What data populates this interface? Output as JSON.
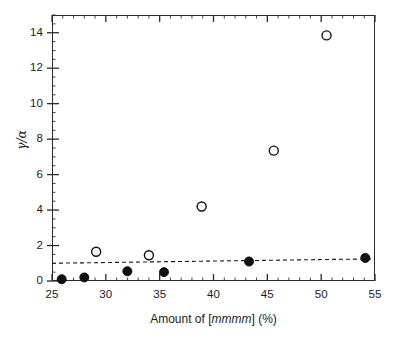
{
  "figure": {
    "background_color": "#ffffff",
    "axis_color": "#2b2b2b"
  },
  "axes": {
    "x_title_prefix": "Amount of [",
    "x_title_italic": "mmmm",
    "x_title_suffix": "] (%)",
    "x_title_full": "Amount of [mmmm] (%)",
    "y_title": "γ/α"
  },
  "chart_data": {
    "type": "scatter",
    "title": "",
    "xlabel": "Amount of [mmmm] (%)",
    "ylabel": "γ/α",
    "xlim": [
      25,
      55
    ],
    "ylim": [
      0,
      15
    ],
    "x_major_ticks": [
      25,
      30,
      35,
      40,
      45,
      50,
      55
    ],
    "x_major_tick_labels": [
      "25",
      "30",
      "35",
      "40",
      "45",
      "50",
      "55"
    ],
    "x_minor_tick_step": 1,
    "y_major_ticks": [
      0,
      2,
      4,
      6,
      8,
      10,
      12,
      14
    ],
    "y_major_tick_labels": [
      "0",
      "2",
      "4",
      "6",
      "8",
      "10",
      "12",
      "14"
    ],
    "y_minor_tick_step": 0.5,
    "grid": false,
    "legend": null,
    "series": [
      {
        "name": "filled-circles",
        "marker": "filled-circle",
        "color": "#111111",
        "marker_size": 9,
        "points": [
          {
            "x": 25.9,
            "y": 0.1
          },
          {
            "x": 28.0,
            "y": 0.2
          },
          {
            "x": 32.0,
            "y": 0.55
          },
          {
            "x": 35.4,
            "y": 0.5
          },
          {
            "x": 43.3,
            "y": 1.1
          },
          {
            "x": 54.1,
            "y": 1.3
          }
        ]
      },
      {
        "name": "open-circles",
        "marker": "open-circle",
        "color": "#111111",
        "marker_size": 9,
        "points": [
          {
            "x": 29.1,
            "y": 1.65
          },
          {
            "x": 34.0,
            "y": 1.45
          },
          {
            "x": 38.9,
            "y": 4.2
          },
          {
            "x": 45.6,
            "y": 7.35
          },
          {
            "x": 50.5,
            "y": 13.85
          }
        ]
      }
    ],
    "annotations": [
      {
        "type": "dashed-reference-line",
        "name": "reference-line",
        "x_start": 25.0,
        "y_start": 1.0,
        "x_end": 55.0,
        "y_end": 1.25,
        "color": "#1a1a1a",
        "dash": "4,3"
      }
    ]
  }
}
